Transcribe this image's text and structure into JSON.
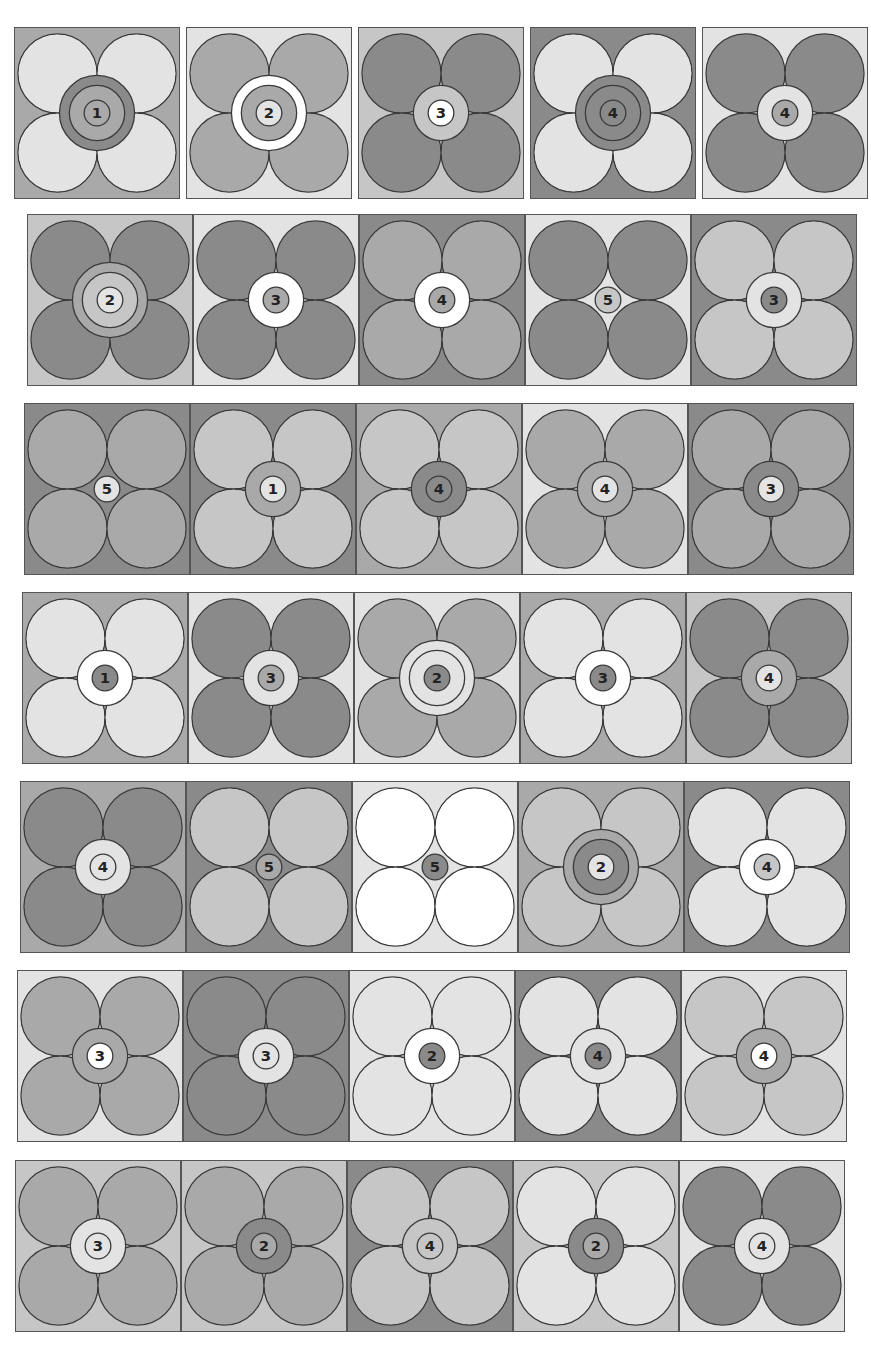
{
  "sheet": {
    "title": "Flower number tiles",
    "shades": {
      "W": "#ffffff",
      "L": "#e3e3e3",
      "M": "#c6c6c6",
      "D": "#a9a9a9",
      "X": "#8a8a8a"
    },
    "outline_color": "#3a3a3a"
  },
  "rows": [
    {
      "top": 27,
      "left": 14,
      "height": 172,
      "gap": true,
      "tiles": [
        {
          "number": "1",
          "bg": "D",
          "petals": "L",
          "rings": [
            "X",
            "D"
          ],
          "num_bg": "D"
        },
        {
          "number": "2",
          "bg": "L",
          "petals": "D",
          "rings": [
            "W",
            "D"
          ],
          "num_bg": "L"
        },
        {
          "number": "3",
          "bg": "M",
          "petals": "X",
          "rings": [
            "M"
          ],
          "num_bg": "W"
        },
        {
          "number": "4",
          "bg": "X",
          "petals": "L",
          "rings": [
            "X",
            "X"
          ],
          "num_bg": "X"
        },
        {
          "number": "4",
          "bg": "L",
          "petals": "X",
          "rings": [
            "L"
          ],
          "num_bg": "D"
        }
      ]
    },
    {
      "top": 214,
      "left": 27,
      "height": 172,
      "gap": false,
      "tiles": [
        {
          "number": "2",
          "bg": "M",
          "petals": "X",
          "rings": [
            "D",
            "M"
          ],
          "num_bg": "L"
        },
        {
          "number": "3",
          "bg": "L",
          "petals": "X",
          "rings": [
            "W"
          ],
          "num_bg": "D"
        },
        {
          "number": "4",
          "bg": "X",
          "petals": "D",
          "rings": [
            "W"
          ],
          "num_bg": "D"
        },
        {
          "number": "5",
          "bg": "L",
          "petals": "X",
          "rings": [],
          "num_bg": "M"
        },
        {
          "number": "3",
          "bg": "X",
          "petals": "M",
          "rings": [
            "L"
          ],
          "num_bg": "X"
        }
      ]
    },
    {
      "top": 403,
      "left": 24,
      "height": 172,
      "gap": false,
      "tiles": [
        {
          "number": "5",
          "bg": "X",
          "petals": "D",
          "rings": [],
          "num_bg": "L"
        },
        {
          "number": "1",
          "bg": "X",
          "petals": "M",
          "rings": [
            "D"
          ],
          "num_bg": "L"
        },
        {
          "number": "4",
          "bg": "D",
          "petals": "M",
          "rings": [
            "X"
          ],
          "num_bg": "X"
        },
        {
          "number": "4",
          "bg": "L",
          "petals": "D",
          "rings": [
            "D"
          ],
          "num_bg": "L"
        },
        {
          "number": "3",
          "bg": "X",
          "petals": "D",
          "rings": [
            "X"
          ],
          "num_bg": "L"
        }
      ]
    },
    {
      "top": 592,
      "left": 22,
      "height": 172,
      "gap": false,
      "tiles": [
        {
          "number": "1",
          "bg": "D",
          "petals": "L",
          "rings": [
            "W"
          ],
          "num_bg": "X"
        },
        {
          "number": "3",
          "bg": "L",
          "petals": "X",
          "rings": [
            "L"
          ],
          "num_bg": "D"
        },
        {
          "number": "2",
          "bg": "L",
          "petals": "D",
          "rings": [
            "L",
            "L"
          ],
          "num_bg": "X"
        },
        {
          "number": "3",
          "bg": "D",
          "petals": "L",
          "rings": [
            "W"
          ],
          "num_bg": "X"
        },
        {
          "number": "4",
          "bg": "M",
          "petals": "X",
          "rings": [
            "D"
          ],
          "num_bg": "L"
        }
      ]
    },
    {
      "top": 781,
      "left": 20,
      "height": 172,
      "gap": false,
      "tiles": [
        {
          "number": "4",
          "bg": "D",
          "petals": "X",
          "rings": [
            "L"
          ],
          "num_bg": "L"
        },
        {
          "number": "5",
          "bg": "X",
          "petals": "M",
          "rings": [],
          "num_bg": "D"
        },
        {
          "number": "5",
          "bg": "L",
          "petals": "W",
          "rings": [],
          "num_bg": "X"
        },
        {
          "number": "2",
          "bg": "D",
          "petals": "M",
          "rings": [
            "D",
            "X"
          ],
          "num_bg": "L"
        },
        {
          "number": "4",
          "bg": "X",
          "petals": "L",
          "rings": [
            "W"
          ],
          "num_bg": "M"
        }
      ]
    },
    {
      "top": 970,
      "left": 17,
      "height": 172,
      "gap": false,
      "tiles": [
        {
          "number": "3",
          "bg": "L",
          "petals": "D",
          "rings": [
            "D"
          ],
          "num_bg": "W"
        },
        {
          "number": "3",
          "bg": "X",
          "petals": "X",
          "rings": [
            "L"
          ],
          "num_bg": "L"
        },
        {
          "number": "2",
          "bg": "L",
          "petals": "L",
          "rings": [
            "W"
          ],
          "num_bg": "X"
        },
        {
          "number": "4",
          "bg": "X",
          "petals": "L",
          "rings": [
            "L"
          ],
          "num_bg": "X"
        },
        {
          "number": "4",
          "bg": "L",
          "petals": "M",
          "rings": [
            "D"
          ],
          "num_bg": "W"
        }
      ]
    },
    {
      "top": 1160,
      "left": 15,
      "height": 172,
      "gap": false,
      "tiles": [
        {
          "number": "3",
          "bg": "M",
          "petals": "D",
          "rings": [
            "L"
          ],
          "num_bg": "L"
        },
        {
          "number": "2",
          "bg": "M",
          "petals": "D",
          "rings": [
            "X"
          ],
          "num_bg": "D"
        },
        {
          "number": "4",
          "bg": "X",
          "petals": "M",
          "rings": [
            "M"
          ],
          "num_bg": "M"
        },
        {
          "number": "2",
          "bg": "M",
          "petals": "L",
          "rings": [
            "X"
          ],
          "num_bg": "D"
        },
        {
          "number": "4",
          "bg": "L",
          "petals": "X",
          "rings": [
            "L"
          ],
          "num_bg": "L"
        }
      ]
    }
  ]
}
